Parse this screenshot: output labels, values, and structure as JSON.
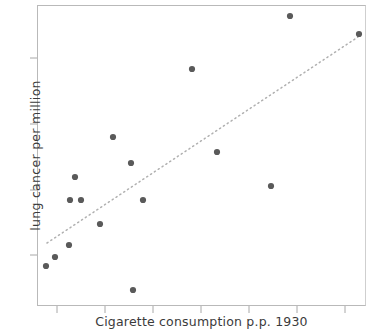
{
  "chart_data": {
    "type": "scatter",
    "title": "",
    "xlabel": "Cigarette consumption p.p.  1930",
    "ylabel": "lung cancer  per  million",
    "grid": false,
    "legend": null,
    "xlim": [
      0,
      1
    ],
    "ylim": [
      0,
      1
    ],
    "x_tick_labels": [
      "",
      "",
      "",
      "",
      "",
      "",
      ""
    ],
    "y_tick_labels": [
      "",
      "",
      "",
      ""
    ],
    "x_tick_positions": [
      57,
      105,
      153,
      201,
      249,
      297,
      345
    ],
    "y_tick_positions": [
      58,
      124,
      190,
      255
    ],
    "point_color": "#5a5a5a",
    "point_radius": 3.1,
    "trendline": {
      "style": "dotted",
      "color": "#b0b0b0",
      "x1": 47,
      "y1": 243,
      "x2": 358,
      "y2": 37
    },
    "points": [
      {
        "px": 290,
        "py": 16
      },
      {
        "px": 359,
        "py": 34
      },
      {
        "px": 192,
        "py": 69
      },
      {
        "px": 113,
        "py": 137
      },
      {
        "px": 217,
        "py": 152
      },
      {
        "px": 131,
        "py": 163
      },
      {
        "px": 75,
        "py": 177
      },
      {
        "px": 271,
        "py": 186
      },
      {
        "px": 70,
        "py": 200
      },
      {
        "px": 81,
        "py": 200
      },
      {
        "px": 143,
        "py": 200
      },
      {
        "px": 100,
        "py": 224
      },
      {
        "px": 69,
        "py": 245
      },
      {
        "px": 55,
        "py": 257
      },
      {
        "px": 46,
        "py": 266
      },
      {
        "px": 133,
        "py": 290
      }
    ]
  }
}
